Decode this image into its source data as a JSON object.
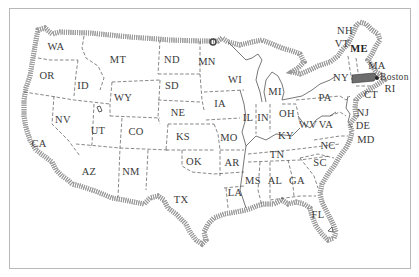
{
  "map": {
    "title": "United States map with state abbreviations",
    "highlight_city": {
      "label": "Boston",
      "x": 380,
      "y": 79
    },
    "states": [
      {
        "abbr": "WA",
        "x": 56,
        "y": 50
      },
      {
        "abbr": "OR",
        "x": 47,
        "y": 79
      },
      {
        "abbr": "ID",
        "x": 83,
        "y": 89
      },
      {
        "abbr": "MT",
        "x": 118,
        "y": 63
      },
      {
        "abbr": "WY",
        "x": 123,
        "y": 101
      },
      {
        "abbr": "ND",
        "x": 172,
        "y": 63
      },
      {
        "abbr": "SD",
        "x": 172,
        "y": 89
      },
      {
        "abbr": "MN",
        "x": 207,
        "y": 65
      },
      {
        "abbr": "NE",
        "x": 178,
        "y": 116
      },
      {
        "abbr": "NV",
        "x": 63,
        "y": 123
      },
      {
        "abbr": "UT",
        "x": 98,
        "y": 134
      },
      {
        "abbr": "CO",
        "x": 136,
        "y": 135
      },
      {
        "abbr": "KS",
        "x": 183,
        "y": 140
      },
      {
        "abbr": "CA",
        "x": 39,
        "y": 147
      },
      {
        "abbr": "AZ",
        "x": 89,
        "y": 175
      },
      {
        "abbr": "NM",
        "x": 131,
        "y": 175
      },
      {
        "abbr": "OK",
        "x": 194,
        "y": 165
      },
      {
        "abbr": "TX",
        "x": 181,
        "y": 203
      },
      {
        "abbr": "WI",
        "x": 235,
        "y": 83
      },
      {
        "abbr": "IA",
        "x": 220,
        "y": 107
      },
      {
        "abbr": "IL",
        "x": 248,
        "y": 121
      },
      {
        "abbr": "MO",
        "x": 229,
        "y": 141
      },
      {
        "abbr": "AR",
        "x": 232,
        "y": 166
      },
      {
        "abbr": "LA",
        "x": 235,
        "y": 196
      },
      {
        "abbr": "MS",
        "x": 253,
        "y": 184
      },
      {
        "abbr": "AL",
        "x": 275,
        "y": 184
      },
      {
        "abbr": "GA",
        "x": 297,
        "y": 184
      },
      {
        "abbr": "FL",
        "x": 318,
        "y": 218
      },
      {
        "abbr": "MI",
        "x": 275,
        "y": 95
      },
      {
        "abbr": "IN",
        "x": 263,
        "y": 121
      },
      {
        "abbr": "OH",
        "x": 287,
        "y": 117
      },
      {
        "abbr": "KY",
        "x": 286,
        "y": 139
      },
      {
        "abbr": "TN",
        "x": 277,
        "y": 158
      },
      {
        "abbr": "WV",
        "x": 308,
        "y": 128
      },
      {
        "abbr": "VA",
        "x": 326,
        "y": 128
      },
      {
        "abbr": "NC",
        "x": 328,
        "y": 149
      },
      {
        "abbr": "SC",
        "x": 320,
        "y": 166
      },
      {
        "abbr": "PA",
        "x": 325,
        "y": 101
      },
      {
        "abbr": "NY",
        "x": 341,
        "y": 81
      },
      {
        "abbr": "NJ",
        "x": 363,
        "y": 116
      },
      {
        "abbr": "DE",
        "x": 363,
        "y": 129
      },
      {
        "abbr": "MD",
        "x": 366,
        "y": 143
      },
      {
        "abbr": "CT",
        "x": 371,
        "y": 98
      },
      {
        "abbr": "RI",
        "x": 390,
        "y": 92
      },
      {
        "abbr": "MA",
        "x": 377,
        "y": 69
      },
      {
        "abbr": "ME",
        "x": 359,
        "y": 52,
        "bold": true
      },
      {
        "abbr": "VT",
        "x": 342,
        "y": 47
      },
      {
        "abbr": "NH",
        "x": 345,
        "y": 34
      }
    ],
    "colors": {
      "frame": "#b8b8b8",
      "coast": "#444444",
      "hatch": "#9a9a9a",
      "border": "#555555",
      "label": "#3a3a3a",
      "massachusetts_fill": "#6d6d6d"
    }
  }
}
